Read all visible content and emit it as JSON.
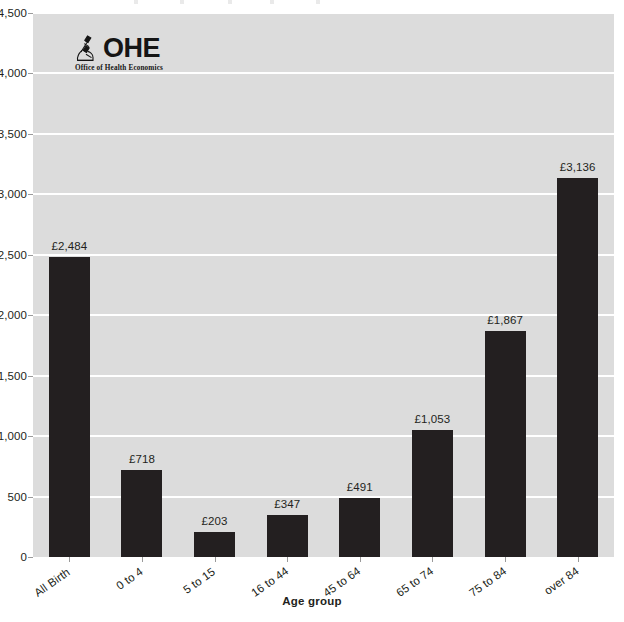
{
  "chart_data": {
    "type": "bar",
    "title": "",
    "xlabel": "Age group",
    "ylabel": "",
    "categories": [
      "All Birth",
      "0 to 4",
      "5 to 15",
      "16 to 44",
      "45 to 64",
      "65 to 74",
      "75 to 84",
      "over 84"
    ],
    "values": [
      2484,
      718,
      203,
      347,
      491,
      1053,
      1867,
      3136
    ],
    "value_labels": [
      "£2,484",
      "£718",
      "£203",
      "£347",
      "£491",
      "£1,053",
      "£1,867",
      "£3,136"
    ],
    "ylim": [
      0,
      4500
    ],
    "ytick_values": [
      0,
      500,
      1000,
      1500,
      2000,
      2500,
      3000,
      3500,
      4000,
      4500
    ],
    "ytick_labels": [
      "0",
      "500",
      "1,000",
      "1,500",
      "2,000",
      "2,500",
      "3,000",
      "3,500",
      "4,000",
      "4,500"
    ],
    "grid": true,
    "legend": "none",
    "bar_color": "#231f20",
    "plot_background": "#dcdcdc",
    "gridline_color": "#ffffff"
  },
  "branding": {
    "logo_text": "OHE",
    "logo_tagline": "Office of Health Economics",
    "logo_icon": "microscope-icon"
  }
}
